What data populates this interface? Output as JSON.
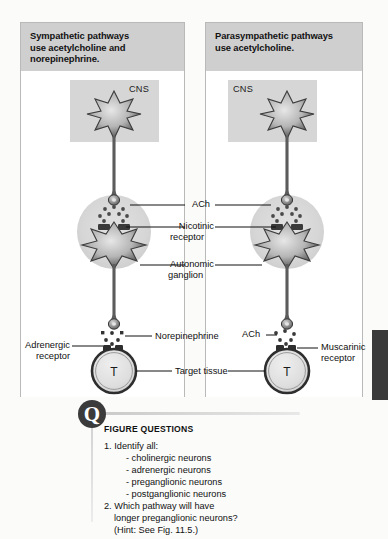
{
  "figure": {
    "background_color": "#fbfbfa"
  },
  "panels": [
    {
      "id": "sympathetic",
      "header": "Sympathetic pathways use acetylcholine and norepinephrine.",
      "header_lines": [
        "Sympathetic pathways",
        "use acetylcholine and",
        "norepinephrine."
      ],
      "cns_label": "CNS",
      "target_letter": "T"
    },
    {
      "id": "parasympathetic",
      "header": "Parasympathetic pathways use acetylcholine.",
      "header_lines": [
        "Parasympathetic pathways",
        "use acetylcholine."
      ],
      "cns_label": "CNS",
      "target_letter": "T"
    }
  ],
  "center_labels": {
    "ach": "ACh",
    "nicotinic_receptor_line1": "Nicotinic",
    "nicotinic_receptor_line2": "receptor",
    "autonomic_ganglion_line1": "Autonomic",
    "autonomic_ganglion_line2": "ganglion",
    "target_tissue": "Target tissue",
    "norepinephrine": "Norepinephrine"
  },
  "left_labels": {
    "adrenergic_receptor_line1": "Adrenergic",
    "adrenergic_receptor_line2": "receptor"
  },
  "right_labels": {
    "ach": "ACh",
    "muscarinic_receptor_line1": "Muscarinic",
    "muscarinic_receptor_line2": "receptor"
  },
  "figure_questions": {
    "title": "FIGURE QUESTIONS",
    "items": [
      "1. Identify all:",
      "- cholinergic neurons",
      "- adrenergic neurons",
      "- preganglionic neurons",
      "- postganglionic neurons",
      "2. Which pathway will have",
      "longer preganglionic neurons?",
      "(Hint: See Fig. 11.5.)"
    ]
  },
  "colors": {
    "panel_header_bg": "#cfcfcf",
    "panel_border": "#b9b9b9",
    "cns_box_bg": "#d6d6d6",
    "ganglion_fill": "#d8d8d8",
    "neuron_dark": "#3a3a3a",
    "axon": "#585858",
    "badge_bg": "#3b3b3b",
    "edge_tab": "#3a3a3a"
  }
}
